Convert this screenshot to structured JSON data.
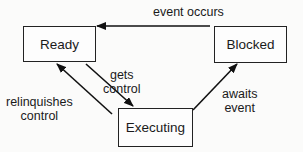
{
  "diagram": {
    "type": "state-transition",
    "states": [
      {
        "id": "ready",
        "label": "Ready"
      },
      {
        "id": "blocked",
        "label": "Blocked"
      },
      {
        "id": "executing",
        "label": "Executing"
      }
    ],
    "transitions": [
      {
        "from": "blocked",
        "to": "ready",
        "label": "event occurs"
      },
      {
        "from": "ready",
        "to": "executing",
        "label_line1": "gets",
        "label_line2": "control"
      },
      {
        "from": "executing",
        "to": "ready",
        "label_line1": "relinquishes",
        "label_line2": "control"
      },
      {
        "from": "executing",
        "to": "blocked",
        "label_line1": "awaits",
        "label_line2": "event"
      }
    ]
  },
  "colors": {
    "stroke": "#1a1a1a",
    "background": "#fbfbfa"
  }
}
